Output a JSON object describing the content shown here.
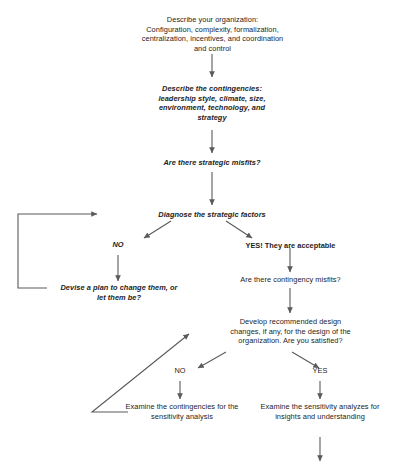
{
  "diagram": {
    "type": "flowchart",
    "colors": {
      "line": "#5a5a5a",
      "text": "#1d1d1d",
      "background": "#ffffff"
    },
    "nodes": {
      "describe_organization": "Describe your organization:\nConfiguration, complexity, formalization,\ncentralization, incentives, and coordination\nand control",
      "describe_contingencies": "Describe the contingencies:\nleadership style, climate, size,\nenvironment, technology, and\nstrategy",
      "strategic_misfits_question": "Are there strategic misfits?",
      "diagnose_factors": "Diagnose the strategic factors",
      "branch_no_1": "NO",
      "branch_yes_1": "YES! They are acceptable",
      "devise_plan": "Devise a plan to change them, or\nlet them be?",
      "contingency_misfits_question": "Are there contingency misfits?",
      "develop_changes": "Develop recommended design\nchanges, if any, for the design of the\norganization. Are you satisfied?",
      "branch_no_2": "NO",
      "branch_yes_2": "YES",
      "examine_contingencies": "Examine the contingencies for the\nsensitivity analysis",
      "examine_sensitivity": "Examine the sensitivity analyzes for\ninsights and understanding"
    }
  }
}
